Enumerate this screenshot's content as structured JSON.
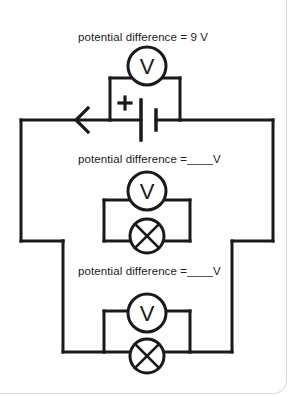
{
  "diagram": {
    "type": "electrical-circuit-diagram",
    "stroke_color": "#1a1a1a",
    "background_color": "#ffffff",
    "border_color": "#d8d8d8",
    "labels": {
      "supply": "potential difference = 9 V",
      "lamp_one": "potential difference =____V",
      "lamp_two": "potential difference =____V"
    },
    "components": {
      "battery": {
        "name": "battery",
        "polarity_label": "+",
        "supply_voltage": "9 V"
      },
      "current_arrow": {
        "name": "current-direction-arrow",
        "direction": "left"
      },
      "voltmeter_supply": {
        "name": "voltmeter",
        "glyph": "V"
      },
      "voltmeter_lamp_one": {
        "name": "voltmeter",
        "glyph": "V"
      },
      "voltmeter_lamp_two": {
        "name": "voltmeter",
        "glyph": "V"
      },
      "lamp_one": {
        "name": "lamp",
        "glyph": "crossed-circle"
      },
      "lamp_two": {
        "name": "lamp",
        "glyph": "crossed-circle"
      }
    }
  }
}
